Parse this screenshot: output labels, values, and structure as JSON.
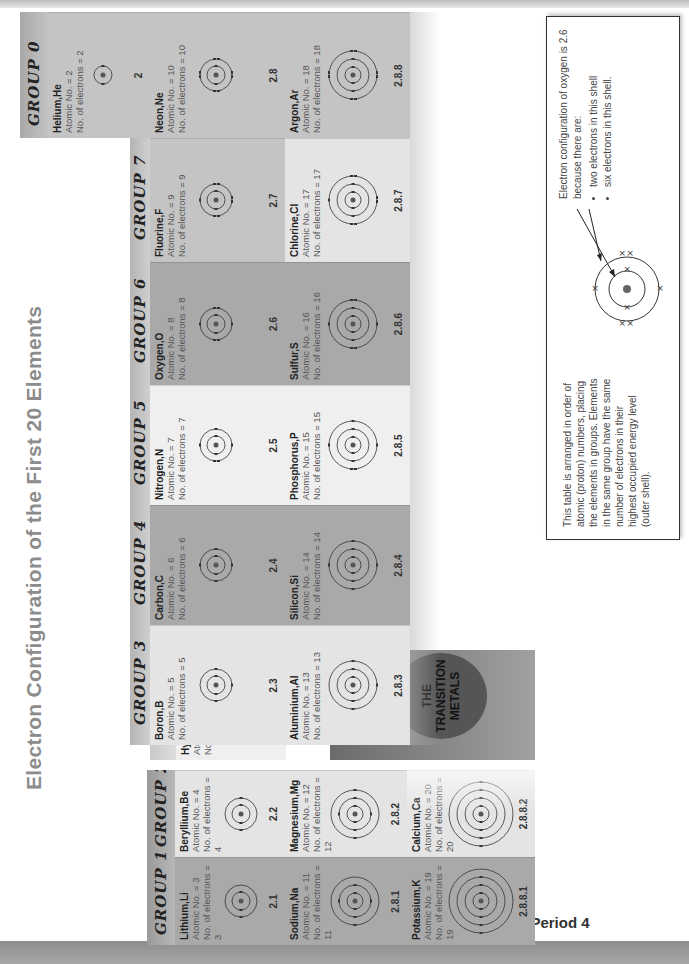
{
  "title": "Electron Configuration of the First 20 Elements",
  "periods": [
    "Period 1",
    "Period 2",
    "Period 3",
    "Period 4"
  ],
  "groups": [
    "GROUP 1",
    "GROUP 2",
    "GROUP 3",
    "GROUP 4",
    "GROUP 5",
    "GROUP 6",
    "GROUP 7",
    "GROUP 0"
  ],
  "transition_metals_label": "THE TRANSITION METALS",
  "elements": {
    "H": {
      "name": "Hydrogen,H",
      "atomic": "Atomic No. = 1",
      "electrons": "No. of electrons = 1",
      "config": "1"
    },
    "He": {
      "name": "Helium,He",
      "atomic": "Atomic No. = 2",
      "electrons": "No. of electrons = 2",
      "config": "2"
    },
    "Li": {
      "name": "Lithium,Li",
      "atomic": "Atomic No. = 3",
      "electrons": "No. of electrons = 3",
      "config": "2.1"
    },
    "Be": {
      "name": "Beryllium,Be",
      "atomic": "Atomic No. = 4",
      "electrons": "No. of electrons = 4",
      "config": "2.2"
    },
    "B": {
      "name": "Boron,B",
      "atomic": "Atomic No. = 5",
      "electrons": "No. of electrons = 5",
      "config": "2.3"
    },
    "C": {
      "name": "Carbon,C",
      "atomic": "Atomic No. = 6",
      "electrons": "No. of electrons = 6",
      "config": "2.4"
    },
    "N": {
      "name": "Nitrogen,N",
      "atomic": "Atomic No. = 7",
      "electrons": "No. of electrons = 7",
      "config": "2.5"
    },
    "O": {
      "name": "Oxygen,O",
      "atomic": "Atomic No. = 8",
      "electrons": "No. of electrons = 8",
      "config": "2.6"
    },
    "F": {
      "name": "Fluorine,F",
      "atomic": "Atomic No. = 9",
      "electrons": "No. of electrons = 9",
      "config": "2.7"
    },
    "Ne": {
      "name": "Neon,Ne",
      "atomic": "Atomic No. = 10",
      "electrons": "No. of electrons = 10",
      "config": "2.8"
    },
    "Na": {
      "name": "Sodium,Na",
      "atomic": "Atomic No. = 11",
      "electrons": "No. of electrons = 11",
      "config": "2.8.1"
    },
    "Mg": {
      "name": "Magnesium,Mg",
      "atomic": "Atomic No. = 12",
      "electrons": "No. of electrons = 12",
      "config": "2.8.2"
    },
    "Al": {
      "name": "Aluminium,Al",
      "atomic": "Atomic No. = 13",
      "electrons": "No. of electrons = 13",
      "config": "2.8.3"
    },
    "Si": {
      "name": "Silicon,Si",
      "atomic": "Atomic No. = 14",
      "electrons": "No. of electrons = 14",
      "config": "2.8.4"
    },
    "P": {
      "name": "Phosphorus,P",
      "atomic": "Atomic No. = 15",
      "electrons": "No. of electrons = 15",
      "config": "2.8.5"
    },
    "S": {
      "name": "Sulfur,S",
      "atomic": "Atomic No. = 16",
      "electrons": "No. of electrons = 16",
      "config": "2.8.6"
    },
    "Cl": {
      "name": "Chlorine,Cl",
      "atomic": "Atomic No. = 17",
      "electrons": "No. of electrons = 17",
      "config": "2.8.7"
    },
    "Ar": {
      "name": "Argon,Ar",
      "atomic": "Atomic No. = 18",
      "electrons": "No. of electrons = 18",
      "config": "2.8.8"
    },
    "K": {
      "name": "Potassium,K",
      "atomic": "Atomic No. = 19",
      "electrons": "No. of electrons = 19",
      "config": "2.8.8.1"
    },
    "Ca": {
      "name": "Calcium,Ca",
      "atomic": "Atomic No. = 20",
      "electrons": "No. of electrons = 20",
      "config": "2.8.8.2"
    }
  },
  "info_box": {
    "left_text": "This table is arranged in order of atomic (proton) numbers, placing the elements in groups. Elements in the same group have the same number of electrons in their highest occupied energy level (outer shell).",
    "right_intro": "Electron configuration of oxygen is 2.6 because there are:",
    "bullets": [
      "two electrons in this shell",
      "six electrons in this shell."
    ]
  }
}
